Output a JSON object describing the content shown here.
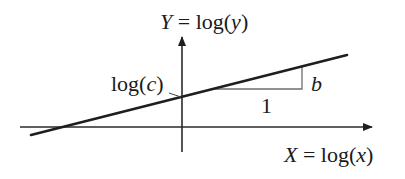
{
  "diagram": {
    "type": "log-log linear relationship",
    "y_axis_label": {
      "var": "Y",
      "eq": " = log(",
      "inner": "y",
      "close": ")"
    },
    "x_axis_label": {
      "var": "X",
      "eq": " = log(",
      "inner": "x",
      "close": ")"
    },
    "intercept_label": {
      "prefix": "log(",
      "inner": "c",
      "close": ")"
    },
    "slope_rise_label": "b",
    "slope_run_label": "1",
    "colors": {
      "line": "#1e1e1e",
      "axis": "#2a2a2a",
      "triangle": "#6e6e6e",
      "background": "#ffffff"
    }
  }
}
